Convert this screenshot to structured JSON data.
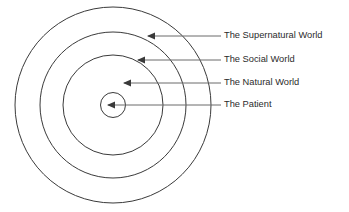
{
  "diagram": {
    "type": "concentric-circles",
    "background_color": "#ffffff",
    "ring_stroke_color": "#3a3a3a",
    "leader_color": "#6b6b6b",
    "label_color": "#2b2b2b",
    "center": {
      "x": 113,
      "y": 105
    },
    "layers": [
      {
        "label": "The Supernatural World",
        "ring_index": 1,
        "radius": 98,
        "arrow_tip": {
          "x": 148,
          "y": 36
        },
        "leader_end": {
          "x": 221,
          "y": 36
        },
        "label_pos": {
          "x": 224,
          "y": 36
        }
      },
      {
        "label": "The Social World",
        "ring_index": 2,
        "radius": 73,
        "arrow_tip": {
          "x": 138,
          "y": 60
        },
        "leader_end": {
          "x": 221,
          "y": 60
        },
        "label_pos": {
          "x": 224,
          "y": 60
        }
      },
      {
        "label": "The Natural World",
        "ring_index": 3,
        "radius": 50,
        "arrow_tip": {
          "x": 124,
          "y": 83
        },
        "leader_end": {
          "x": 221,
          "y": 83
        },
        "label_pos": {
          "x": 224,
          "y": 83
        }
      },
      {
        "label": "The Patient",
        "ring_index": 4,
        "radius": 12.5,
        "arrow_tip": {
          "x": 108,
          "y": 105
        },
        "leader_end": {
          "x": 221,
          "y": 105
        },
        "label_pos": {
          "x": 224,
          "y": 105
        }
      }
    ]
  }
}
